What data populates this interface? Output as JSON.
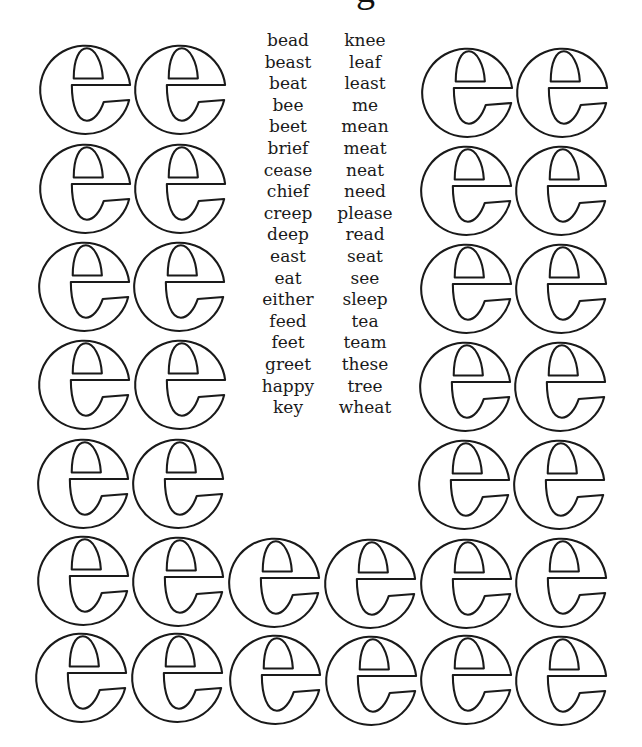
{
  "page": {
    "title_fragment": "g",
    "word_list": {
      "left_column": [
        "bead",
        "beast",
        "beat",
        "bee",
        "beet",
        "brief",
        "cease",
        "chief",
        "creep",
        "deep",
        "east",
        "eat",
        "either",
        "feed",
        "feet",
        "greet",
        "happy",
        "key"
      ],
      "right_column": [
        "knee",
        "leaf",
        "least",
        "me",
        "mean",
        "meat",
        "neat",
        "need",
        "please",
        "read",
        "seat",
        "see",
        "sleep",
        "tea",
        "team",
        "these",
        "tree",
        "wheat"
      ]
    },
    "letters": {
      "glyph": "e",
      "style": "outline",
      "stroke_color": "#1a1a1a",
      "fill_color": "#ffffff",
      "count": 32,
      "layout": {
        "top_left_pairs_rows": 5,
        "top_right_pairs_rows": 5,
        "bottom_full_rows": 2,
        "bottom_row_count": 6
      }
    }
  }
}
